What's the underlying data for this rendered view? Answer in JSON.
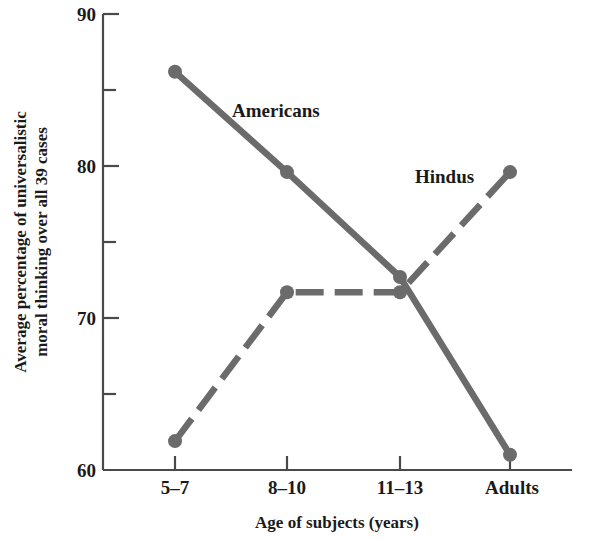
{
  "chart_data": {
    "type": "line",
    "title": "",
    "xlabel": "Age of subjects (years)",
    "ylabel": "Average percentage of universalistic moral thinking over all 39 cases",
    "ylabel_line1": "Average percentage of universalistic",
    "ylabel_line2": "moral thinking over all 39 cases",
    "categories": [
      "5–7",
      "8–10",
      "11–13",
      "Adults"
    ],
    "ylim": [
      60,
      90
    ],
    "ytick_labels": [
      "90",
      "80",
      "70",
      "60"
    ],
    "ytick_values": [
      90,
      80,
      70,
      60
    ],
    "yminor_ticks": [
      85,
      75,
      65
    ],
    "grid": false,
    "legend_position": "inline-annotations",
    "series": [
      {
        "name": "Americans",
        "label": "Americans",
        "style": "solid",
        "color": "#6b6b6b",
        "marker": "circle",
        "values": [
          86.2,
          79.6,
          72.7,
          61.0
        ]
      },
      {
        "name": "Hindus",
        "label": "Hindus",
        "style": "dashed",
        "color": "#6b6b6b",
        "marker": "circle",
        "values": [
          61.9,
          71.7,
          71.7,
          79.6
        ]
      }
    ],
    "annotations": [
      {
        "text": "Americans",
        "x_category": "8–10",
        "y_value": 84.0
      },
      {
        "text": "Hindus",
        "x_category": "11–13",
        "y_value": 79.8
      }
    ]
  },
  "colors": {
    "line": "#6b6b6b",
    "axis": "#4a4a4a",
    "text": "#1a1a1a",
    "background": "#ffffff"
  }
}
